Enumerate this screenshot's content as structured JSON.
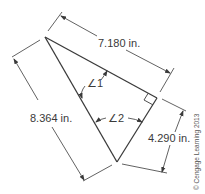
{
  "figure": {
    "type": "right triangle with dimension lines",
    "dimensions": {
      "top": "7.180 in.",
      "left": "8.364 in.",
      "right": "4.290 in."
    },
    "angles": {
      "angle1": "∠1",
      "angle2": "∠2"
    },
    "right_angle_marker": true,
    "copyright": "© Cengage Learning 2013",
    "colors": {
      "line": "#3a3a3a",
      "text": "#3a3a3a"
    }
  }
}
